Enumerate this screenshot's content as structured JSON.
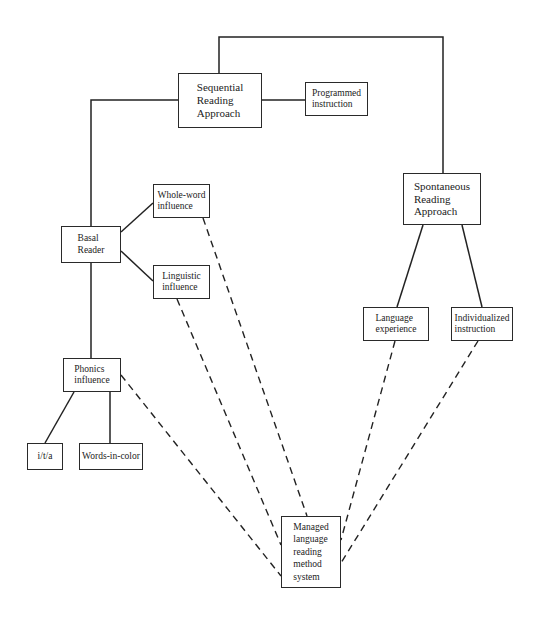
{
  "diagram": {
    "nodes": [
      {
        "id": "sequential",
        "label": "Sequential\nReading\nApproach"
      },
      {
        "id": "programmed",
        "label": "Programmed\ninstruction"
      },
      {
        "id": "spontaneous",
        "label": "Spontaneous\nReading\nApproach"
      },
      {
        "id": "basal",
        "label": "Basal\nReader"
      },
      {
        "id": "whole_word",
        "label": "Whole-word\ninfluence"
      },
      {
        "id": "linguistic",
        "label": "Linguistic\ninfluence"
      },
      {
        "id": "language_experience",
        "label": "Language\nexperience"
      },
      {
        "id": "individualized",
        "label": "Individualized\ninstruction"
      },
      {
        "id": "phonics",
        "label": "Phonics\ninfluence"
      },
      {
        "id": "ita",
        "label": "i/t/a"
      },
      {
        "id": "words_in_color",
        "label": "Words-in-color"
      },
      {
        "id": "managed",
        "label": "Managed\nlanguage\nreading\nmethod\nsystem"
      }
    ],
    "edges": [
      {
        "from": "sequential",
        "to": "spontaneous",
        "style": "solid"
      },
      {
        "from": "sequential",
        "to": "programmed",
        "style": "solid"
      },
      {
        "from": "sequential",
        "to": "basal",
        "style": "solid"
      },
      {
        "from": "basal",
        "to": "whole_word",
        "style": "solid"
      },
      {
        "from": "basal",
        "to": "linguistic",
        "style": "solid"
      },
      {
        "from": "basal",
        "to": "phonics",
        "style": "solid"
      },
      {
        "from": "phonics",
        "to": "ita",
        "style": "solid"
      },
      {
        "from": "phonics",
        "to": "words_in_color",
        "style": "solid"
      },
      {
        "from": "spontaneous",
        "to": "language_experience",
        "style": "solid"
      },
      {
        "from": "spontaneous",
        "to": "individualized",
        "style": "solid"
      },
      {
        "from": "whole_word",
        "to": "managed",
        "style": "dashed"
      },
      {
        "from": "linguistic",
        "to": "managed",
        "style": "dashed"
      },
      {
        "from": "phonics",
        "to": "managed",
        "style": "dashed"
      },
      {
        "from": "language_experience",
        "to": "managed",
        "style": "dashed"
      },
      {
        "from": "individualized",
        "to": "managed",
        "style": "dashed"
      }
    ]
  }
}
